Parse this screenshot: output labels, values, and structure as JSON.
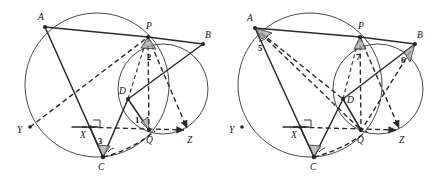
{
  "figure": {
    "stroke_color": "#2b2b2b",
    "circle_color": "#4a4a4a",
    "wedge_fill": "#a8a8a8",
    "background": "#ffffff",
    "panels": [
      {
        "id": "left-panel",
        "name": "left-figure",
        "circles": [
          {
            "name": "large-circle",
            "cx": 97,
            "cy": 85,
            "r": 72
          },
          {
            "name": "small-circle",
            "cx": 163,
            "cy": 89,
            "r": 45
          }
        ],
        "points": [
          {
            "label": "A",
            "name": "point-a",
            "x": 45,
            "y": 27,
            "lx": 38,
            "ly": 20
          },
          {
            "label": "P",
            "name": "point-p",
            "x": 148,
            "y": 37,
            "lx": 146,
            "ly": 29
          },
          {
            "label": "B",
            "name": "point-b",
            "x": 203,
            "y": 44,
            "lx": 205,
            "ly": 38
          },
          {
            "label": "D",
            "name": "point-d",
            "x": 128,
            "y": 99,
            "lx": 119,
            "ly": 94
          },
          {
            "label": "X",
            "name": "point-x",
            "x": 90,
            "y": 127,
            "lx": 80,
            "ly": 138
          },
          {
            "label": "Y",
            "name": "point-y",
            "x": 30,
            "y": 127,
            "lx": 17,
            "ly": 133
          },
          {
            "label": "Q",
            "name": "point-q",
            "x": 149,
            "y": 130,
            "lx": 149,
            "ly": 142
          },
          {
            "label": "Z",
            "name": "point-z",
            "x": 189,
            "y": 130,
            "lx": 190,
            "ly": 142
          },
          {
            "label": "C",
            "name": "point-c",
            "x": 103,
            "y": 157,
            "lx": 99,
            "ly": 170
          }
        ],
        "angles": [
          {
            "label": "1",
            "name": "angle-1",
            "x": 137,
            "y": 120
          },
          {
            "label": "2",
            "name": "angle-2",
            "x": 150,
            "y": 57
          },
          {
            "label": "3",
            "name": "angle-3",
            "x": 100,
            "y": 142
          }
        ],
        "solid_segments": [
          {
            "name": "segment-ap",
            "x1": 45,
            "y1": 27,
            "x2": 148,
            "y2": 37
          },
          {
            "name": "segment-pb",
            "x1": 148,
            "y1": 37,
            "x2": 203,
            "y2": 44
          },
          {
            "name": "segment-ac",
            "x1": 45,
            "y1": 27,
            "x2": 103,
            "y2": 157
          },
          {
            "name": "segment-bd",
            "x1": 203,
            "y1": 44,
            "x2": 128,
            "y2": 99
          },
          {
            "name": "segment-dc",
            "x1": 128,
            "y1": 99,
            "x2": 103,
            "y2": 157
          },
          {
            "name": "segment-dq",
            "x1": 128,
            "y1": 99,
            "x2": 149,
            "y2": 130
          },
          {
            "name": "segment-xc",
            "x1": 90,
            "y1": 127,
            "x2": 103,
            "y2": 157
          }
        ],
        "dashed_segments": [
          {
            "name": "dashed-yp",
            "x1": 30,
            "y1": 127,
            "x2": 148,
            "y2": 37
          },
          {
            "name": "dashed-pq",
            "x1": 148,
            "y1": 37,
            "x2": 149,
            "y2": 130
          },
          {
            "name": "dashed-pz",
            "x1": 148,
            "y1": 37,
            "x2": 189,
            "y2": 130
          },
          {
            "name": "dashed-xz",
            "x1": 82,
            "y1": 127,
            "x2": 186,
            "y2": 130
          },
          {
            "name": "dashed-cq",
            "x1": 103,
            "y1": 157,
            "x2": 152,
            "y2": 132
          },
          {
            "name": "dashed-dp",
            "x1": 128,
            "y1": 99,
            "x2": 146,
            "y2": 40
          }
        ]
      },
      {
        "id": "right-panel",
        "name": "right-figure",
        "circles": [
          {
            "name": "large-circle",
            "cx": 310,
            "cy": 85,
            "r": 72
          },
          {
            "name": "small-circle",
            "cx": 378,
            "cy": 89,
            "r": 45
          }
        ],
        "points": [
          {
            "label": "A",
            "name": "point-a",
            "x": 255,
            "y": 28,
            "lx": 247,
            "ly": 21
          },
          {
            "label": "P",
            "name": "point-p",
            "x": 360,
            "y": 37,
            "lx": 358,
            "ly": 29
          },
          {
            "label": "B",
            "name": "point-b",
            "x": 415,
            "y": 44,
            "lx": 417,
            "ly": 38
          },
          {
            "label": "D",
            "name": "point-d",
            "x": 343,
            "y": 99,
            "lx": 347,
            "ly": 102
          },
          {
            "label": "X",
            "name": "point-x",
            "x": 300,
            "y": 127,
            "lx": 291,
            "ly": 138
          },
          {
            "label": "Y",
            "name": "point-y",
            "x": 242,
            "y": 127,
            "lx": 229,
            "ly": 133
          },
          {
            "label": "Q",
            "name": "point-q",
            "x": 361,
            "y": 130,
            "lx": 358,
            "ly": 142
          },
          {
            "label": "Z",
            "name": "point-z",
            "x": 401,
            "y": 130,
            "lx": 402,
            "ly": 142
          },
          {
            "label": "C",
            "name": "point-c",
            "x": 314,
            "y": 157,
            "lx": 310,
            "ly": 170
          }
        ],
        "angles": [
          {
            "label": "5",
            "name": "angle-5",
            "x": 261,
            "y": 48
          },
          {
            "label": "6",
            "name": "angle-6",
            "x": 404,
            "y": 60
          },
          {
            "label": "7",
            "name": "angle-7",
            "x": 358,
            "y": 57
          }
        ],
        "solid_segments": [
          {
            "name": "segment-ap",
            "x1": 255,
            "y1": 28,
            "x2": 360,
            "y2": 37
          },
          {
            "name": "segment-pb",
            "x1": 360,
            "y1": 37,
            "x2": 415,
            "y2": 44
          },
          {
            "name": "segment-ac",
            "x1": 255,
            "y1": 28,
            "x2": 314,
            "y2": 157
          },
          {
            "name": "segment-bd",
            "x1": 415,
            "y1": 44,
            "x2": 343,
            "y2": 99
          },
          {
            "name": "segment-dc",
            "x1": 343,
            "y1": 99,
            "x2": 314,
            "y2": 157
          },
          {
            "name": "segment-dq",
            "x1": 343,
            "y1": 99,
            "x2": 361,
            "y2": 130
          },
          {
            "name": "segment-xc",
            "x1": 300,
            "y1": 127,
            "x2": 314,
            "y2": 157
          }
        ],
        "dashed_segments": [
          {
            "name": "dashed-ad",
            "x1": 255,
            "y1": 28,
            "x2": 343,
            "y2": 99
          },
          {
            "name": "dashed-aq",
            "x1": 255,
            "y1": 28,
            "x2": 361,
            "y2": 130
          },
          {
            "name": "dashed-pq",
            "x1": 360,
            "y1": 37,
            "x2": 361,
            "y2": 130
          },
          {
            "name": "dashed-pz",
            "x1": 360,
            "y1": 37,
            "x2": 401,
            "y2": 130
          },
          {
            "name": "dashed-bq",
            "x1": 415,
            "y1": 44,
            "x2": 361,
            "y2": 130
          },
          {
            "name": "dashed-xz",
            "x1": 293,
            "y1": 127,
            "x2": 398,
            "y2": 130
          },
          {
            "name": "dashed-cq",
            "x1": 314,
            "y1": 157,
            "x2": 364,
            "y2": 132
          },
          {
            "name": "dashed-dp",
            "x1": 343,
            "y1": 99,
            "x2": 358,
            "y2": 40
          }
        ]
      }
    ]
  }
}
